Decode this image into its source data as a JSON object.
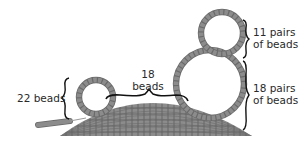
{
  "diagram": {
    "type": "beadwork-diagram",
    "colors": {
      "bead": "#8a8a8a",
      "bead_edge": "#6a6a6a",
      "bead_highlight": "#a8a8a8",
      "brace": "#111111",
      "text": "#2a2a2a",
      "background": "#ffffff"
    },
    "labels": {
      "left_loop": "22 beads",
      "bridge_line1": "18",
      "bridge_line2": "beads",
      "top_loop_line1": "11 pairs",
      "top_loop_line2": "of beads",
      "big_loop_line1": "18 pairs",
      "big_loop_line2": "of beads"
    },
    "elements": [
      {
        "name": "dome-base",
        "description": "dome of beadwork"
      },
      {
        "name": "tail-strand",
        "description": "strand of beads leading into base"
      },
      {
        "name": "small-loop",
        "count_label": "22 beads"
      },
      {
        "name": "bridge",
        "count_label": "18 beads"
      },
      {
        "name": "top-loop",
        "count_label": "11 pairs of beads"
      },
      {
        "name": "big-loop",
        "count_label": "18 pairs of beads"
      }
    ]
  }
}
